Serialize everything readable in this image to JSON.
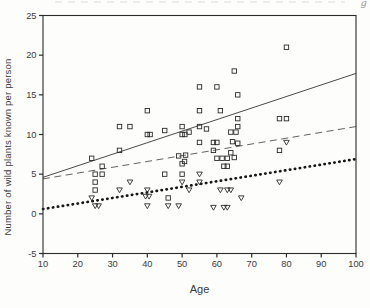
{
  "figure": {
    "y_axis_label": "Number of wild plants known per person",
    "x_axis_label": "Age"
  },
  "scan_artifacts": {
    "top_right_glyph": "g"
  },
  "chart_data": {
    "type": "scatter",
    "title": "",
    "xlabel": "Age",
    "ylabel": "Number of wild plants known per person",
    "xlim": [
      10,
      100
    ],
    "ylim": [
      -5,
      25
    ],
    "x_ticks": [
      10,
      20,
      30,
      40,
      50,
      60,
      70,
      80,
      90,
      100
    ],
    "y_ticks": [
      -5,
      0,
      5,
      10,
      15,
      20,
      25
    ],
    "grid": false,
    "legend": "none",
    "series": [
      {
        "name": "squares-group",
        "marker": "open-square",
        "points": [
          [
            80,
            21
          ],
          [
            65,
            18
          ],
          [
            55,
            16
          ],
          [
            60,
            16
          ],
          [
            66,
            15
          ],
          [
            40,
            13
          ],
          [
            55,
            13
          ],
          [
            61,
            13
          ],
          [
            66,
            12
          ],
          [
            78,
            12
          ],
          [
            80,
            12
          ],
          [
            32,
            11
          ],
          [
            35,
            11
          ],
          [
            50,
            11
          ],
          [
            55,
            11
          ],
          [
            66,
            11
          ],
          [
            45,
            10.5
          ],
          [
            40,
            10
          ],
          [
            40.8,
            10
          ],
          [
            50,
            10
          ],
          [
            50.8,
            10
          ],
          [
            52,
            10.3
          ],
          [
            57,
            10.7
          ],
          [
            64,
            10.3
          ],
          [
            65.5,
            10.3
          ],
          [
            55,
            9
          ],
          [
            59,
            9
          ],
          [
            60,
            9
          ],
          [
            64.5,
            9.1
          ],
          [
            66,
            8.9
          ],
          [
            32,
            8
          ],
          [
            59,
            8
          ],
          [
            78,
            8
          ],
          [
            64,
            7.7
          ],
          [
            24,
            7
          ],
          [
            49,
            7.3
          ],
          [
            51,
            7.4
          ],
          [
            60,
            7
          ],
          [
            61.5,
            7
          ],
          [
            63,
            7
          ],
          [
            65,
            7.1
          ],
          [
            27,
            6
          ],
          [
            50,
            6.3
          ],
          [
            50.7,
            6.6
          ],
          [
            62,
            6
          ],
          [
            63,
            6
          ],
          [
            25,
            5
          ],
          [
            27,
            5
          ],
          [
            45,
            5
          ],
          [
            50,
            5
          ],
          [
            25,
            4
          ],
          [
            25,
            3
          ],
          [
            46,
            2
          ]
        ]
      },
      {
        "name": "triangles-group",
        "marker": "open-triangle-down",
        "points": [
          [
            80,
            9
          ],
          [
            78,
            4
          ],
          [
            55,
            5
          ],
          [
            35,
            4
          ],
          [
            50,
            4
          ],
          [
            55,
            4
          ],
          [
            32,
            3
          ],
          [
            40,
            3
          ],
          [
            52,
            3
          ],
          [
            61,
            3
          ],
          [
            63,
            3
          ],
          [
            64,
            3
          ],
          [
            24,
            2
          ],
          [
            39.5,
            2.2
          ],
          [
            40.5,
            2.2
          ],
          [
            67,
            2
          ],
          [
            25,
            1
          ],
          [
            26,
            1
          ],
          [
            40,
            1
          ],
          [
            46,
            1
          ],
          [
            49,
            1
          ],
          [
            59,
            0.8
          ],
          [
            62,
            0.8
          ],
          [
            63,
            0.8
          ]
        ]
      }
    ],
    "lines": [
      {
        "name": "solid-regression",
        "style": "solid",
        "x": [
          10,
          100
        ],
        "y": [
          4.6,
          17.7
        ]
      },
      {
        "name": "dashed-regression",
        "style": "dashed",
        "x": [
          10,
          100
        ],
        "y": [
          4.4,
          11.0
        ]
      },
      {
        "name": "dotted-regression",
        "style": "bold-dotted",
        "x": [
          10,
          100
        ],
        "y": [
          0.6,
          6.9
        ]
      }
    ]
  }
}
